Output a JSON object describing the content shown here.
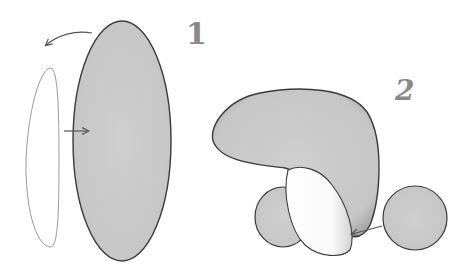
{
  "steps": [
    {
      "number": "1"
    },
    {
      "number": "2"
    }
  ],
  "colors": {
    "shape_fill": "#c9c9c9",
    "shape_outline": "#444444",
    "highlight": "#ffffff",
    "label": "#8a8a8a"
  }
}
